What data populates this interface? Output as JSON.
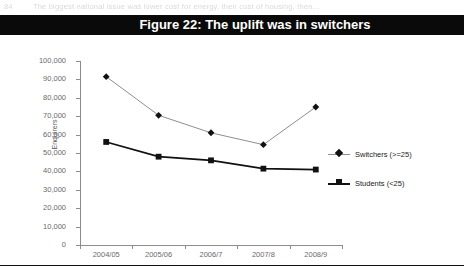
{
  "page": {
    "running_header_number": "84",
    "running_header_text": "The biggest national issue was lower cost for energy, then cost of housing, then..."
  },
  "figure": {
    "title": "Figure 22: The uplift was in switchers"
  },
  "chart_data": {
    "type": "line",
    "title": "Figure 22: The uplift was in switchers",
    "xlabel": "",
    "ylabel": "Enquirers",
    "categories": [
      "2004/05",
      "2005/06",
      "2006/7",
      "2007/8",
      "2008/9"
    ],
    "series": [
      {
        "name": "Switchers (>=25)",
        "marker": "diamond",
        "color": "#111111",
        "line_color": "#8e8e8e",
        "values": [
          91500,
          70500,
          61000,
          54500,
          75000
        ]
      },
      {
        "name": "Students (<25)",
        "marker": "square",
        "color": "#111111",
        "line_color": "#111111",
        "values": [
          56000,
          48000,
          46000,
          41500,
          41000
        ]
      }
    ],
    "ylim": [
      0,
      100000
    ],
    "ytick_labels": [
      "100,000",
      "90,000",
      "80,000",
      "70,000",
      "60,000",
      "50,000",
      "40,000",
      "30,000",
      "20,000",
      "10,000",
      "0"
    ],
    "ytick_values": [
      100000,
      90000,
      80000,
      70000,
      60000,
      50000,
      40000,
      30000,
      20000,
      10000,
      0
    ],
    "grid": false,
    "legend_position": "right"
  },
  "colors": {
    "title_band_bg": "#0a0a0a",
    "title_band_text": "#ffffff",
    "axis": "#8d8d8d",
    "tick_label": "#6a6a6a",
    "series_switchers_line": "#8e8e8e",
    "series_students_line": "#111111",
    "marker": "#111111"
  }
}
